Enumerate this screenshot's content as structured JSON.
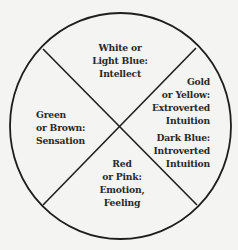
{
  "diagram": {
    "type": "circle divided into four quadrants by an X",
    "colors": {
      "background": "#f4f4f2",
      "stroke": "#1e1e1e",
      "text": "#2a2a2a"
    },
    "quadrants": {
      "top": {
        "lines": [
          "White or",
          "Light Blue:",
          "Intellect"
        ]
      },
      "right": {
        "lines": [
          "Gold",
          "or Yellow:",
          "Extroverted",
          "Intuition"
        ],
        "lines2": [
          "Dark Blue:",
          "Introverted",
          "Intuition"
        ]
      },
      "left": {
        "lines": [
          "Green",
          "or Brown:",
          "Sensation"
        ]
      },
      "bottom": {
        "lines": [
          "Red",
          "or Pink:",
          "Emotion,",
          "Feeling"
        ]
      }
    }
  }
}
